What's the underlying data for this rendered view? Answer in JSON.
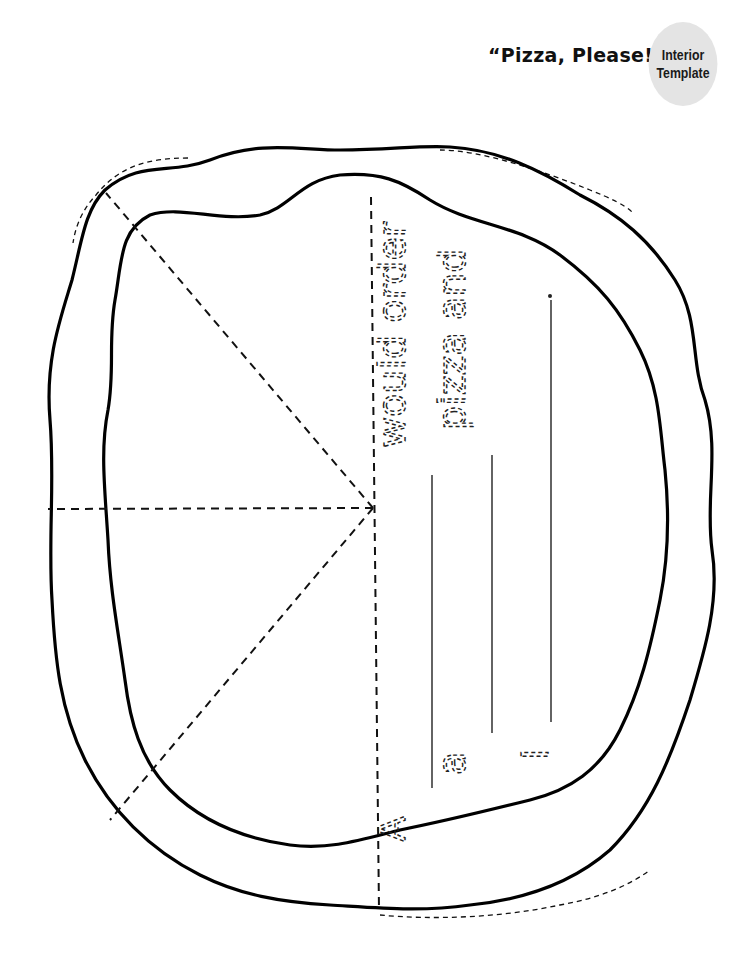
{
  "header": {
    "title": "“Pizza, Please!”",
    "badge_line1": "Interior",
    "badge_line2": "Template"
  },
  "worksheet": {
    "orientation": "rotated-90-clockwise",
    "lines": [
      {
        "prefix": "A",
        "blank": "__________",
        "suffix": "would order"
      },
      {
        "prefix": "a",
        "blank": "__________",
        "suffix": "pizza and"
      },
      {
        "prefix": "I",
        "blank": "__________",
        "suffix": "."
      }
    ],
    "pizza_slices": 6
  },
  "colors": {
    "ink": "#111111",
    "badge_bg": "#e4e4e4",
    "page_bg": "#ffffff"
  }
}
